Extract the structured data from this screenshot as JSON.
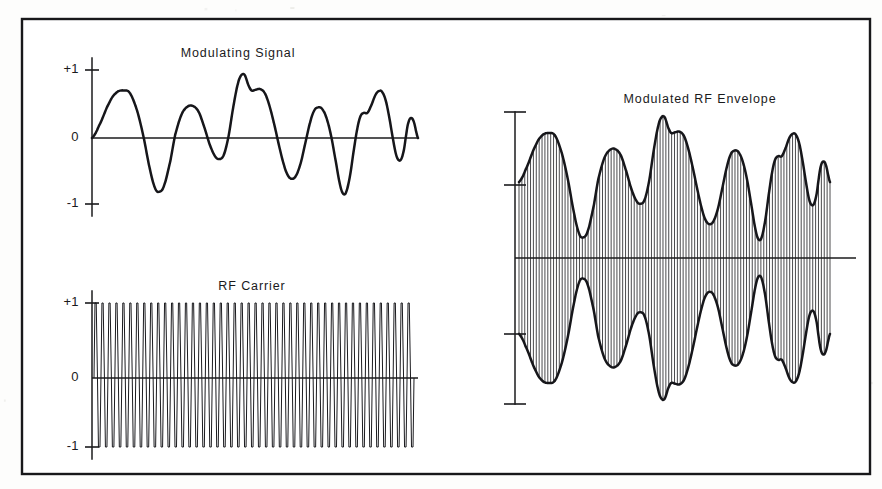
{
  "figure": {
    "background_color": "#fdfdfc",
    "ink_color": "#16161a",
    "frame": {
      "x": 22,
      "y": 19,
      "width": 848,
      "height": 455,
      "stroke_width": 2.4
    }
  },
  "panels": {
    "modulating": {
      "title": "Modulating Signal",
      "title_x": 238,
      "title_y": 57,
      "axis_x": 92,
      "zero_y": 138,
      "plus_one_y": 70,
      "minus_one_y": 204,
      "plot_right": 418,
      "labels": {
        "plus_one": "+1",
        "zero": "0",
        "minus_one": "-1"
      }
    },
    "carrier": {
      "title": "RF Carrier",
      "title_x": 252,
      "title_y": 290,
      "axis_x": 92,
      "zero_y": 378,
      "plus_one_y": 303,
      "minus_one_y": 447,
      "plot_right": 418,
      "labels": {
        "plus_one": "+1",
        "zero": "0",
        "minus_one": "-1"
      }
    },
    "envelope": {
      "title": "Modulated RF Envelope",
      "title_x": 700,
      "title_y": 103,
      "axis_x": 515,
      "zero_y": 258,
      "top_cap_y": 112,
      "upper_tick_y": 185,
      "lower_tick_y": 334,
      "bottom_cap_y": 404,
      "plot_left": 519,
      "plot_right": 830,
      "zero_line_right": 856,
      "tick_half_width": 11
    }
  },
  "chart_data": {
    "type": "line",
    "xlabel": "",
    "ylabel": "Amplitude (normalized)",
    "ylim": [
      -1,
      1
    ],
    "grid": false,
    "legend": "none",
    "series": [
      {
        "name": "Modulating Signal",
        "type": "line",
        "ylim": [
          -1,
          1
        ],
        "ytick_labels": [
          "+1",
          "0",
          "-1"
        ],
        "ytick_values": [
          1,
          0,
          -1
        ],
        "comment": "Hand-drawn quasi-periodic audio-like waveform, ~6 major cycles, amplitude varies 0.3-0.95",
        "control_points": [
          [
            0.0,
            0.0
          ],
          [
            0.022,
            0.18
          ],
          [
            0.055,
            0.52
          ],
          [
            0.078,
            0.67
          ],
          [
            0.1,
            0.7
          ],
          [
            0.12,
            0.66
          ],
          [
            0.143,
            0.4
          ],
          [
            0.163,
            0.02
          ],
          [
            0.183,
            -0.45
          ],
          [
            0.2,
            -0.74
          ],
          [
            0.213,
            -0.79
          ],
          [
            0.228,
            -0.7
          ],
          [
            0.248,
            -0.34
          ],
          [
            0.263,
            0.04
          ],
          [
            0.283,
            0.34
          ],
          [
            0.302,
            0.46
          ],
          [
            0.32,
            0.47
          ],
          [
            0.338,
            0.38
          ],
          [
            0.357,
            0.14
          ],
          [
            0.373,
            -0.1
          ],
          [
            0.39,
            -0.27
          ],
          [
            0.403,
            -0.31
          ],
          [
            0.417,
            -0.25
          ],
          [
            0.432,
            0.02
          ],
          [
            0.447,
            0.45
          ],
          [
            0.462,
            0.8
          ],
          [
            0.474,
            0.93
          ],
          [
            0.484,
            0.92
          ],
          [
            0.495,
            0.78
          ],
          [
            0.505,
            0.7
          ],
          [
            0.518,
            0.71
          ],
          [
            0.532,
            0.72
          ],
          [
            0.547,
            0.66
          ],
          [
            0.562,
            0.47
          ],
          [
            0.578,
            0.18
          ],
          [
            0.593,
            -0.13
          ],
          [
            0.608,
            -0.4
          ],
          [
            0.62,
            -0.55
          ],
          [
            0.632,
            -0.6
          ],
          [
            0.645,
            -0.56
          ],
          [
            0.66,
            -0.38
          ],
          [
            0.675,
            -0.08
          ],
          [
            0.69,
            0.22
          ],
          [
            0.703,
            0.4
          ],
          [
            0.715,
            0.45
          ],
          [
            0.728,
            0.43
          ],
          [
            0.742,
            0.3
          ],
          [
            0.757,
            0.03
          ],
          [
            0.772,
            -0.35
          ],
          [
            0.785,
            -0.68
          ],
          [
            0.795,
            -0.82
          ],
          [
            0.805,
            -0.79
          ],
          [
            0.817,
            -0.55
          ],
          [
            0.828,
            -0.2
          ],
          [
            0.84,
            0.14
          ],
          [
            0.85,
            0.32
          ],
          [
            0.86,
            0.37
          ],
          [
            0.872,
            0.37
          ],
          [
            0.885,
            0.49
          ],
          [
            0.897,
            0.63
          ],
          [
            0.908,
            0.69
          ],
          [
            0.918,
            0.68
          ],
          [
            0.93,
            0.55
          ],
          [
            0.942,
            0.28
          ],
          [
            0.953,
            -0.02
          ],
          [
            0.963,
            -0.25
          ],
          [
            0.972,
            -0.33
          ],
          [
            0.98,
            -0.3
          ],
          [
            0.988,
            -0.16
          ],
          [
            0.995,
            0.06
          ],
          [
            1.0,
            0.2
          ],
          [
            1.006,
            0.28
          ],
          [
            1.013,
            0.29
          ],
          [
            1.02,
            0.22
          ],
          [
            1.027,
            0.08
          ],
          [
            1.032,
            0.0
          ]
        ]
      },
      {
        "name": "RF Carrier",
        "type": "line",
        "ylim": [
          -1,
          1
        ],
        "ytick_labels": [
          "+1",
          "0",
          "-1"
        ],
        "ytick_values": [
          1,
          0,
          -1
        ],
        "waveform": "sine",
        "amplitude": 1.0,
        "cycles": 46,
        "constant_amplitude": true,
        "comment": "Uniform high-frequency sinusoid, constant unity amplitude across the full time axis"
      },
      {
        "name": "Modulated RF Envelope",
        "type": "area",
        "ylim": [
          -1,
          1
        ],
        "comment": "Carrier amplitude = 0.5 + 0.5 * modulating signal; upper envelope drawn heavy, lower envelope is its mirror; vertical hatch lines represent individual carrier cycles",
        "carrier_cycles": 54,
        "modulation_index": 1.0,
        "envelope_offset": 0.52,
        "envelope_depth": 0.48,
        "tick_count": 4,
        "tick_labels": [
          "",
          "",
          "",
          ""
        ]
      }
    ]
  }
}
